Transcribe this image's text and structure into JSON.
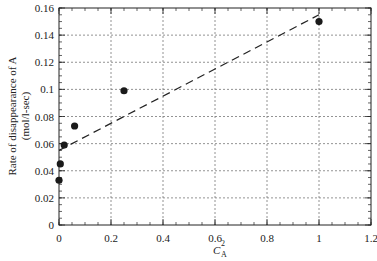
{
  "chart_data": {
    "type": "scatter",
    "title": "",
    "xlabel": "C_A^2",
    "xlabel_main": "C",
    "xlabel_sub": "A",
    "xlabel_sup": "2",
    "ylabel": "Rate of disappearance of A (mol/l-sec)",
    "ylabel_line1": "Rate of disappearance of A",
    "ylabel_line2": "(mol/l-sec)",
    "xlim": [
      0,
      1.2
    ],
    "ylim": [
      0,
      0.16
    ],
    "x_ticks": [
      "0",
      "0.2",
      "0.4",
      "0.6",
      "0.8",
      "1",
      "1.2"
    ],
    "y_ticks": [
      "0",
      "0.02",
      "0.04",
      "0.06",
      "0.08",
      "0.1",
      "0.12",
      "0.14",
      "0.16"
    ],
    "grid": true,
    "series": [
      {
        "name": "data",
        "style": "filled-circle",
        "x": [
          0.0,
          0.005,
          0.02,
          0.06,
          0.25,
          1.0
        ],
        "y": [
          0.033,
          0.045,
          0.059,
          0.073,
          0.099,
          0.15
        ]
      },
      {
        "name": "linear fit",
        "style": "dashed-line",
        "x": [
          0.0,
          1.0
        ],
        "y": [
          0.055,
          0.155
        ]
      }
    ],
    "legend": null
  }
}
